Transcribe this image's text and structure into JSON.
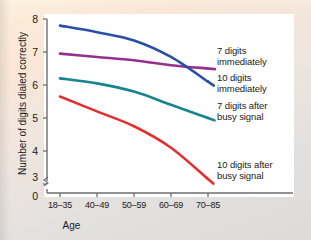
{
  "chart_data": {
    "type": "line",
    "title": "",
    "xlabel": "Age",
    "ylabel": "Number of digits dialed correctly",
    "categories": [
      "18–35",
      "40–49",
      "50–59",
      "60–69",
      "70–85"
    ],
    "ytick_labels": [
      "0",
      "3",
      "4",
      "5",
      "6",
      "7",
      "8"
    ],
    "ylim": [
      3,
      8
    ],
    "y_axis_break": true,
    "grid": false,
    "legend_position": "right-of-lines",
    "series": [
      {
        "name": "7 digits immediately",
        "label": "7 digits\nimmediately",
        "color": "#96308c",
        "values": [
          6.95,
          6.85,
          6.75,
          6.6,
          6.5
        ]
      },
      {
        "name": "10 digits immediately",
        "label": "10 digits\nimmediately",
        "color": "#2b4fa8",
        "values": [
          7.8,
          7.6,
          7.35,
          6.85,
          6.1
        ]
      },
      {
        "name": "7 digits after busy signal",
        "label": "7 digits after\nbusy signal",
        "color": "#15868f",
        "values": [
          6.2,
          6.05,
          5.8,
          5.4,
          5.0
        ]
      },
      {
        "name": "10 digits after busy signal",
        "label": "10 digits after\nbusy signal",
        "color": "#e23030",
        "values": [
          5.65,
          5.2,
          4.75,
          4.1,
          3.15
        ]
      }
    ]
  },
  "axis": {
    "x_title": "Age",
    "y_title": "Number of digits dialed correctly"
  }
}
